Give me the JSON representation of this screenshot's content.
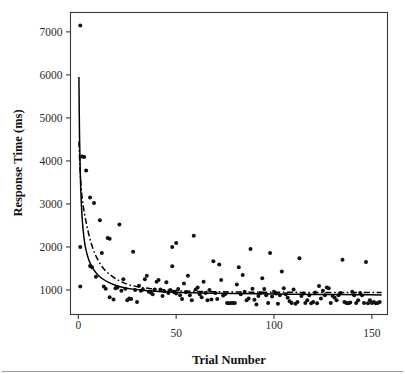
{
  "figure": {
    "background": "#ffffff",
    "has_title": false,
    "footer_rule": true
  },
  "chart_data": {
    "type": "scatter",
    "title": "",
    "xlabel": "Trial Number",
    "ylabel": "Response Time (ms)",
    "xlim": [
      -4,
      158
    ],
    "ylim": [
      430,
      7450
    ],
    "xticks": [
      0,
      50,
      100,
      150
    ],
    "xtick_labels": [
      "0",
      "50",
      "100",
      "150"
    ],
    "yticks": [
      1000,
      2000,
      3000,
      4000,
      5000,
      6000,
      7000
    ],
    "ytick_labels": [
      "1000",
      "2000",
      "3000",
      "4000",
      "5000",
      "6000",
      "7000"
    ],
    "grid": false,
    "legend": false,
    "legend_position": "none",
    "marker": {
      "shape": "circle",
      "size": 2.0,
      "color": "#111111"
    },
    "series": [
      {
        "name": "Response Time observations",
        "type": "scatter",
        "points": [
          [
            1,
            7150
          ],
          [
            1,
            2000
          ],
          [
            1,
            1080
          ],
          [
            2,
            4100
          ],
          [
            3,
            4090
          ],
          [
            4,
            3780
          ],
          [
            6,
            3150
          ],
          [
            8,
            3020
          ],
          [
            6,
            1560
          ],
          [
            7,
            1530
          ],
          [
            9,
            1310
          ],
          [
            11,
            2620
          ],
          [
            12,
            1860
          ],
          [
            13,
            1080
          ],
          [
            14,
            1030
          ],
          [
            15,
            2210
          ],
          [
            16,
            2190
          ],
          [
            16,
            830
          ],
          [
            18,
            780
          ],
          [
            19,
            1040
          ],
          [
            20,
            1060
          ],
          [
            21,
            2520
          ],
          [
            22,
            980
          ],
          [
            23,
            1250
          ],
          [
            24,
            1030
          ],
          [
            25,
            760
          ],
          [
            26,
            800
          ],
          [
            27,
            790
          ],
          [
            28,
            1890
          ],
          [
            29,
            1000
          ],
          [
            30,
            720
          ],
          [
            31,
            1100
          ],
          [
            32,
            980
          ],
          [
            33,
            1010
          ],
          [
            34,
            1250
          ],
          [
            35,
            1330
          ],
          [
            36,
            960
          ],
          [
            37,
            940
          ],
          [
            38,
            900
          ],
          [
            39,
            1010
          ],
          [
            40,
            1190
          ],
          [
            41,
            1230
          ],
          [
            42,
            1010
          ],
          [
            43,
            860
          ],
          [
            44,
            970
          ],
          [
            45,
            1180
          ],
          [
            46,
            930
          ],
          [
            47,
            1000
          ],
          [
            48,
            2000
          ],
          [
            48,
            1550
          ],
          [
            49,
            950
          ],
          [
            50,
            2090
          ],
          [
            50,
            920
          ],
          [
            51,
            1020
          ],
          [
            52,
            880
          ],
          [
            53,
            790
          ],
          [
            54,
            1150
          ],
          [
            55,
            950
          ],
          [
            56,
            1330
          ],
          [
            57,
            880
          ],
          [
            58,
            760
          ],
          [
            59,
            2260
          ],
          [
            60,
            1010
          ],
          [
            61,
            1060
          ],
          [
            62,
            900
          ],
          [
            63,
            830
          ],
          [
            64,
            1190
          ],
          [
            65,
            930
          ],
          [
            66,
            760
          ],
          [
            67,
            1000
          ],
          [
            68,
            780
          ],
          [
            69,
            1670
          ],
          [
            70,
            930
          ],
          [
            71,
            790
          ],
          [
            72,
            1590
          ],
          [
            73,
            1230
          ],
          [
            74,
            870
          ],
          [
            75,
            900
          ],
          [
            76,
            700
          ],
          [
            77,
            690
          ],
          [
            78,
            700
          ],
          [
            79,
            700
          ],
          [
            80,
            700
          ],
          [
            81,
            1130
          ],
          [
            82,
            1530
          ],
          [
            83,
            900
          ],
          [
            84,
            1350
          ],
          [
            85,
            960
          ],
          [
            86,
            760
          ],
          [
            87,
            800
          ],
          [
            88,
            1950
          ],
          [
            89,
            1030
          ],
          [
            90,
            770
          ],
          [
            91,
            660
          ],
          [
            92,
            860
          ],
          [
            93,
            930
          ],
          [
            94,
            1270
          ],
          [
            95,
            1020
          ],
          [
            96,
            880
          ],
          [
            97,
            700
          ],
          [
            98,
            1860
          ],
          [
            99,
            850
          ],
          [
            100,
            960
          ],
          [
            101,
            920
          ],
          [
            102,
            680
          ],
          [
            103,
            880
          ],
          [
            104,
            1430
          ],
          [
            105,
            1040
          ],
          [
            106,
            900
          ],
          [
            107,
            820
          ],
          [
            108,
            740
          ],
          [
            109,
            700
          ],
          [
            110,
            1010
          ],
          [
            111,
            680
          ],
          [
            112,
            720
          ],
          [
            113,
            1740
          ],
          [
            114,
            860
          ],
          [
            115,
            920
          ],
          [
            116,
            700
          ],
          [
            117,
            760
          ],
          [
            118,
            880
          ],
          [
            119,
            690
          ],
          [
            120,
            720
          ],
          [
            121,
            940
          ],
          [
            122,
            690
          ],
          [
            123,
            1090
          ],
          [
            124,
            800
          ],
          [
            125,
            980
          ],
          [
            126,
            880
          ],
          [
            127,
            1060
          ],
          [
            128,
            1040
          ],
          [
            129,
            700
          ],
          [
            130,
            860
          ],
          [
            131,
            820
          ],
          [
            132,
            760
          ],
          [
            133,
            880
          ],
          [
            134,
            930
          ],
          [
            135,
            1700
          ],
          [
            136,
            720
          ],
          [
            137,
            700
          ],
          [
            138,
            690
          ],
          [
            139,
            710
          ],
          [
            140,
            960
          ],
          [
            141,
            880
          ],
          [
            142,
            700
          ],
          [
            143,
            760
          ],
          [
            144,
            930
          ],
          [
            145,
            880
          ],
          [
            146,
            700
          ],
          [
            147,
            1650
          ],
          [
            148,
            690
          ],
          [
            149,
            760
          ],
          [
            150,
            700
          ],
          [
            151,
            720
          ],
          [
            152,
            690
          ],
          [
            153,
            700
          ],
          [
            154,
            720
          ]
        ]
      },
      {
        "name": "Power-law fit (solid)",
        "type": "line",
        "style": "solid",
        "color": "#000000",
        "model": "power",
        "asymptote": 880,
        "start_value": 5950,
        "points": [
          [
            0.3,
            5950
          ],
          [
            0.6,
            4600
          ],
          [
            1.0,
            3700
          ],
          [
            1.5,
            3050
          ],
          [
            2.0,
            2650
          ],
          [
            2.6,
            2330
          ],
          [
            3.3,
            2080
          ],
          [
            4.2,
            1880
          ],
          [
            5.2,
            1720
          ],
          [
            6.5,
            1580
          ],
          [
            8.0,
            1460
          ],
          [
            10.0,
            1350
          ],
          [
            12.5,
            1255
          ],
          [
            15.5,
            1175
          ],
          [
            19,
            1110
          ],
          [
            23,
            1060
          ],
          [
            28,
            1020
          ],
          [
            34,
            990
          ],
          [
            41,
            965
          ],
          [
            49,
            948
          ],
          [
            58,
            935
          ],
          [
            68,
            925
          ],
          [
            80,
            918
          ],
          [
            93,
            910
          ],
          [
            107,
            903
          ],
          [
            120,
            897
          ],
          [
            134,
            892
          ],
          [
            145,
            888
          ],
          [
            155,
            884
          ]
        ]
      },
      {
        "name": "Exponential fit (dash-dot)",
        "type": "line",
        "style": "dashdot",
        "color": "#000000",
        "model": "exponential",
        "asymptote": 940,
        "start_value": 4450,
        "points": [
          [
            0.3,
            4450
          ],
          [
            0.8,
            3900
          ],
          [
            1.4,
            3420
          ],
          [
            2.1,
            3080
          ],
          [
            2.9,
            2840
          ],
          [
            3.8,
            2620
          ],
          [
            4.8,
            2400
          ],
          [
            6.0,
            2180
          ],
          [
            7.4,
            1970
          ],
          [
            9.0,
            1790
          ],
          [
            11.0,
            1620
          ],
          [
            13.2,
            1480
          ],
          [
            15.8,
            1370
          ],
          [
            18.8,
            1270
          ],
          [
            22,
            1190
          ],
          [
            26,
            1120
          ],
          [
            31,
            1070
          ],
          [
            37,
            1030
          ],
          [
            44,
            1000
          ],
          [
            52,
            980
          ],
          [
            62,
            966
          ],
          [
            74,
            956
          ],
          [
            88,
            950
          ],
          [
            104,
            946
          ],
          [
            120,
            943
          ],
          [
            136,
            942
          ],
          [
            150,
            941
          ],
          [
            155,
            941
          ]
        ]
      }
    ]
  }
}
